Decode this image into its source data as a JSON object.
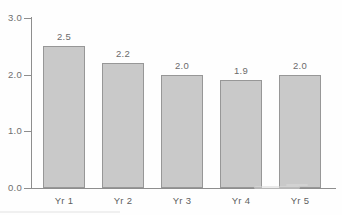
{
  "chart_data": {
    "type": "bar",
    "title": "",
    "subtitle": "",
    "xlabel": "",
    "ylabel": "",
    "categories": [
      "Yr 1",
      "Yr 2",
      "Yr 3",
      "Yr 4",
      "Yr 5"
    ],
    "values": [
      2.5,
      2.2,
      2.0,
      1.9,
      2.0
    ],
    "data_labels": [
      "2.5",
      "2.2",
      "2.0",
      "1.9",
      "2.0"
    ],
    "ylim": [
      0.0,
      3.0
    ],
    "yticks": [
      0.0,
      1.0,
      2.0,
      3.0
    ],
    "ytick_labels": [
      "0.0",
      "1.0",
      "2.0",
      "3.0"
    ],
    "grid": false,
    "legend": null,
    "legend_position": "none",
    "bar_fill_color": "#c9c9c9",
    "bar_border_color": "#979797",
    "axis_color": "#8e8e8e",
    "label_color": "#6b6b6b"
  }
}
